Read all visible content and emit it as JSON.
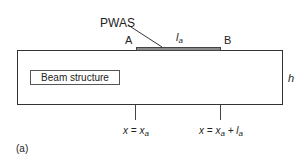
{
  "figure": {
    "beam_label": "Beam structure",
    "pwas_label": "PWAS",
    "end_a_label": "A",
    "end_b_label": "B",
    "length_label": "l",
    "length_sub": "a",
    "height_label": "h",
    "marker_1": {
      "lhs": "x = x",
      "sub": "a"
    },
    "marker_2": {
      "lhs": "x = x",
      "sub": "a",
      "plus": " + l",
      "sub2": "a"
    },
    "panel_label": "(a)"
  },
  "colors": {
    "line": "#333333",
    "pwas_fill": "#8a8a8a",
    "background": "#ffffff"
  }
}
